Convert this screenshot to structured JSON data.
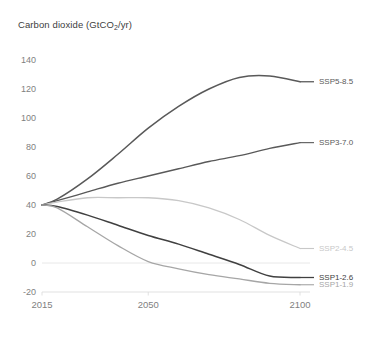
{
  "chart_data": {
    "type": "line",
    "title": "Carbon dioxide (GtCO2/yr)",
    "title_prefix": "Carbon dioxide (GtCO",
    "title_sub": "2",
    "title_suffix": "/yr)",
    "xlabel": "",
    "ylabel": "",
    "xlim": [
      2015,
      2100
    ],
    "ylim": [
      -20,
      140
    ],
    "grid": false,
    "legend_position": "right-inline",
    "xticks": [
      2015,
      2050,
      2100
    ],
    "xtick_labels": [
      "2015",
      "2050",
      "2100"
    ],
    "yticks": [
      -20,
      0,
      20,
      40,
      60,
      80,
      100,
      120,
      140
    ],
    "ytick_labels": [
      "-20",
      "0",
      "20",
      "40",
      "60",
      "80",
      "100",
      "120",
      "140"
    ],
    "x": [
      2015,
      2020,
      2030,
      2040,
      2050,
      2060,
      2070,
      2080,
      2090,
      2100
    ],
    "series": [
      {
        "name": "SSP5-8.5",
        "label": "SSP5-8.5",
        "color": "#595959",
        "width": 1.5,
        "values": [
          40,
          44,
          58,
          75,
          93,
          108,
          120,
          128,
          129,
          125
        ]
      },
      {
        "name": "SSP3-7.0",
        "label": "SSP3-7.0",
        "color": "#595959",
        "width": 1.3,
        "values": [
          40,
          43,
          49,
          55,
          60,
          65,
          70,
          74,
          79,
          83
        ]
      },
      {
        "name": "SSP2-4.5",
        "label": "SSP2-4.5",
        "color": "#c8c8c8",
        "width": 1.3,
        "values": [
          40,
          42,
          45,
          45,
          45,
          43,
          38,
          30,
          19,
          10
        ]
      },
      {
        "name": "SSP1-2.6",
        "label": "SSP1-2.6",
        "color": "#404040",
        "width": 1.5,
        "values": [
          40,
          39,
          33,
          26,
          19,
          13,
          6,
          -1,
          -9,
          -10
        ]
      },
      {
        "name": "SSP1-1.9",
        "label": "SSP1-1.9",
        "color": "#a6a6a6",
        "width": 1.3,
        "values": [
          40,
          38,
          25,
          12,
          1,
          -4,
          -8,
          -11,
          -14,
          -15
        ]
      }
    ]
  }
}
